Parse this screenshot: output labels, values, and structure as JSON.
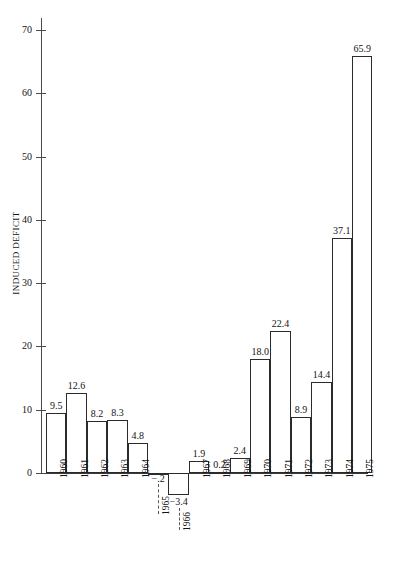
{
  "chart_data": {
    "type": "bar",
    "title": "",
    "xlabel": "",
    "ylabel": "INDUCED DEFICIT",
    "ylim": [
      -5,
      72
    ],
    "yticks": [
      0,
      10,
      20,
      30,
      40,
      50,
      60,
      70
    ],
    "grid": false,
    "legend": null,
    "categories": [
      "1960",
      "1961",
      "1962",
      "1963",
      "1964",
      "1965",
      "1966",
      "1967",
      "1968",
      "1969",
      "1970",
      "1971",
      "1972",
      "1973",
      "1974",
      "1975"
    ],
    "values": [
      9.5,
      12.6,
      8.2,
      8.3,
      4.8,
      -0.2,
      -3.4,
      1.9,
      0.2,
      2.4,
      18.0,
      22.4,
      8.9,
      14.4,
      37.1,
      65.9
    ],
    "value_labels": [
      "9.5",
      "12.6",
      "8.2",
      "8.3",
      "4.8",
      "−.2",
      "−3.4",
      "1.9",
      "0.2",
      "2.4",
      "18.0",
      "22.4",
      "8.9",
      "14.4",
      "37.1",
      "65.9"
    ],
    "offset_label_categories": [
      "1965",
      "1966"
    ]
  },
  "axis": {
    "y_label": "INDUCED DEFICIT",
    "y_tick_labels": [
      "0",
      "10",
      "20",
      "30",
      "40",
      "50",
      "60",
      "70"
    ]
  },
  "caption": {
    "text": ""
  }
}
